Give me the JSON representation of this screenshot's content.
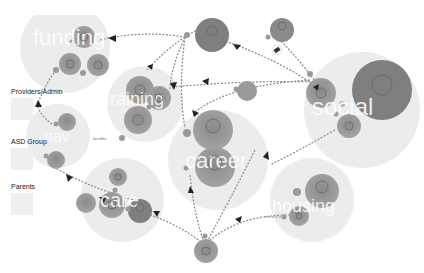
{
  "legend": {
    "items": [
      {
        "label": "Providers/Admin",
        "color": "#efefef"
      },
      {
        "label": "ASD Group",
        "color": "#efefef"
      },
      {
        "label": "Parents",
        "color": "#efefef"
      }
    ]
  },
  "clusters": [
    {
      "id": "funding",
      "label": "funding",
      "cx": 65,
      "cy": 48,
      "r": 45
    },
    {
      "id": "training",
      "label": "training",
      "cx": 145,
      "cy": 105,
      "r": 38
    },
    {
      "id": "nav",
      "label": "nav",
      "cx": 55,
      "cy": 135,
      "r": 32
    },
    {
      "id": "social",
      "label": "social",
      "cx": 360,
      "cy": 110,
      "r": 58
    },
    {
      "id": "career",
      "label": "career",
      "cx": 220,
      "cy": 160,
      "r": 50
    },
    {
      "id": "care",
      "label": "care",
      "cx": 120,
      "cy": 200,
      "r": 42
    },
    {
      "id": "housing",
      "label": "housing",
      "cx": 312,
      "cy": 200,
      "r": 42
    }
  ],
  "annotations": {
    "nav_side_label": "locnoffer"
  },
  "colors": {
    "cluster_fill": "#e8e8e8",
    "node_fill": "#9a9a9a",
    "node_dark": "#7a7a7a",
    "edge": "#888888",
    "cluster_text": "#ffffff"
  }
}
